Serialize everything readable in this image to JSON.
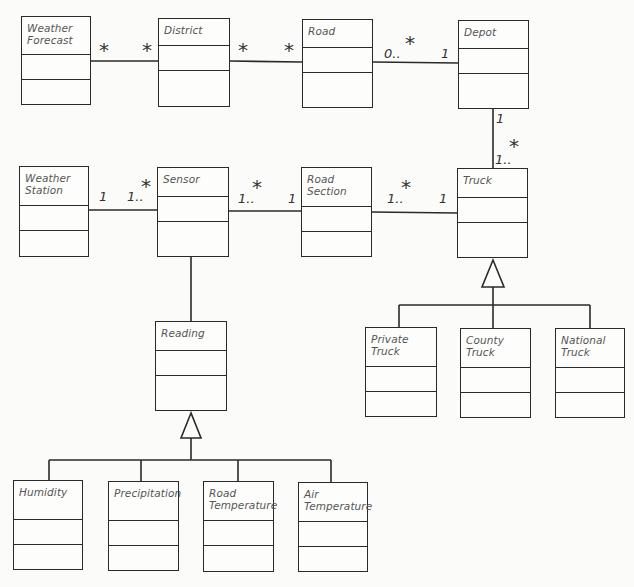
{
  "diagram": {
    "type": "UML class diagram",
    "classes": [
      {
        "id": "weather_forecast",
        "name": "Weather\nForecast",
        "x": 21,
        "y": 16,
        "w": 70,
        "h": 89,
        "name_h": 38,
        "attrs_h": 25
      },
      {
        "id": "district",
        "name": "District",
        "x": 158,
        "y": 18,
        "w": 72,
        "h": 89,
        "name_h": 27,
        "attrs_h": 25
      },
      {
        "id": "road",
        "name": "Road",
        "x": 302,
        "y": 19,
        "w": 71,
        "h": 89,
        "name_h": 28,
        "attrs_h": 25
      },
      {
        "id": "depot",
        "name": "Depot",
        "x": 458,
        "y": 20,
        "w": 71,
        "h": 89,
        "name_h": 28,
        "attrs_h": 25
      },
      {
        "id": "weather_station",
        "name": "Weather\nStation",
        "x": 19,
        "y": 166,
        "w": 70,
        "h": 91,
        "name_h": 39,
        "attrs_h": 25
      },
      {
        "id": "sensor",
        "name": "Sensor",
        "x": 157,
        "y": 167,
        "w": 72,
        "h": 90,
        "name_h": 29,
        "attrs_h": 25
      },
      {
        "id": "road_section",
        "name": "Road\nSection",
        "x": 301,
        "y": 167,
        "w": 71,
        "h": 90,
        "name_h": 39,
        "attrs_h": 25
      },
      {
        "id": "truck",
        "name": "Truck",
        "x": 457,
        "y": 168,
        "w": 71,
        "h": 90,
        "name_h": 29,
        "attrs_h": 25
      },
      {
        "id": "reading",
        "name": "Reading",
        "x": 155,
        "y": 321,
        "w": 72,
        "h": 90,
        "name_h": 29,
        "attrs_h": 25
      },
      {
        "id": "private_truck",
        "name": "Private\nTruck",
        "x": 365,
        "y": 327,
        "w": 72,
        "h": 90,
        "name_h": 39,
        "attrs_h": 25
      },
      {
        "id": "county_truck",
        "name": "County\nTruck",
        "x": 460,
        "y": 328,
        "w": 71,
        "h": 90,
        "name_h": 39,
        "attrs_h": 25
      },
      {
        "id": "national_truck",
        "name": "National\nTruck",
        "x": 555,
        "y": 328,
        "w": 70,
        "h": 90,
        "name_h": 39,
        "attrs_h": 25
      },
      {
        "id": "humidity",
        "name": "Humidity",
        "x": 13,
        "y": 480,
        "w": 70,
        "h": 90,
        "name_h": 39,
        "attrs_h": 25
      },
      {
        "id": "precipitation",
        "name": "Precipitation",
        "x": 108,
        "y": 481,
        "w": 71,
        "h": 90,
        "name_h": 39,
        "attrs_h": 25
      },
      {
        "id": "road_temperature",
        "name": "Road\nTemperature",
        "x": 203,
        "y": 481,
        "w": 71,
        "h": 91,
        "name_h": 39,
        "attrs_h": 25
      },
      {
        "id": "air_temperature",
        "name": "Air\nTemperature",
        "x": 298,
        "y": 482,
        "w": 70,
        "h": 90,
        "name_h": 39,
        "attrs_h": 25
      }
    ],
    "associations": [
      {
        "from": "weather_forecast",
        "to": "district",
        "from_mult": "*",
        "to_mult": "*"
      },
      {
        "from": "district",
        "to": "road",
        "from_mult": "*",
        "to_mult": "*"
      },
      {
        "from": "road",
        "to": "depot",
        "from_mult": "0..*",
        "to_mult": "1"
      },
      {
        "from": "depot",
        "to": "truck",
        "from_mult": "1",
        "to_mult": "1..*"
      },
      {
        "from": "weather_station",
        "to": "sensor",
        "from_mult": "1",
        "to_mult": "1..*"
      },
      {
        "from": "sensor",
        "to": "road_section",
        "from_mult": "1..*",
        "to_mult": "1"
      },
      {
        "from": "road_section",
        "to": "truck",
        "from_mult": "1..*",
        "to_mult": "1"
      },
      {
        "from": "sensor",
        "to": "reading",
        "from_mult": "",
        "to_mult": ""
      }
    ],
    "generalizations": [
      {
        "parent": "truck",
        "children": [
          "private_truck",
          "county_truck",
          "national_truck"
        ]
      },
      {
        "parent": "reading",
        "children": [
          "humidity",
          "precipitation",
          "road_temperature",
          "air_temperature"
        ]
      }
    ],
    "labels": {
      "wf_district_left": "*",
      "wf_district_right": "*",
      "district_road_left": "*",
      "district_road_right": "*",
      "road_depot_left_num": "0..",
      "road_depot_left_star": "*",
      "road_depot_right": "1",
      "depot_truck_top": "1",
      "depot_truck_bottom_num": "1..",
      "depot_truck_bottom_star": "*",
      "ws_sensor_left": "1",
      "ws_sensor_right_num": "1..",
      "ws_sensor_right_star": "*",
      "sensor_rs_left_num": "1..",
      "sensor_rs_left_star": "*",
      "sensor_rs_right": "1",
      "rs_truck_left_num": "1..",
      "rs_truck_left_star": "*",
      "rs_truck_right": "1"
    },
    "colors": {
      "line": "#2a2a2a",
      "text": "#555555",
      "background": "#fbfbf9"
    }
  }
}
